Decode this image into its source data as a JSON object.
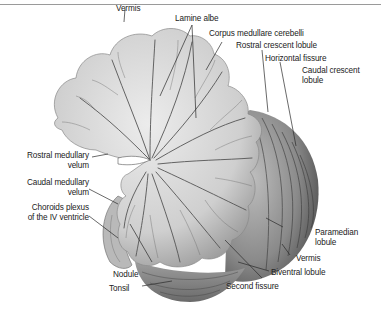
{
  "figure": {
    "labels": {
      "vermis_top": "Vermis",
      "lamine_albe": "Lamine albe",
      "corpus_medullare": "Corpus medullare cerebelli",
      "rostral_crescent": "Rostral crescent lobule",
      "horizontal_fissure": "Horizontal fissure",
      "caudal_crescent_1": "Caudal crescent",
      "caudal_crescent_2": "lobule",
      "rostral_medullary_1": "Rostral medullary",
      "rostral_medullary_2": "velum",
      "caudal_medullary_1": "Caudal medullary",
      "caudal_medullary_2": "velum",
      "choroids_1": "Choroids plexus",
      "choroids_2": "of the IV ventricle",
      "paramedian_1": "Paramedian",
      "paramedian_2": "lobule",
      "vermis_bottom": "Vermis",
      "biventral": "Biventral lobule",
      "nodule": "Nodule",
      "tonsil": "Tonsil",
      "second_fissure": "Second fissure"
    },
    "colors": {
      "white_matter": "#e6e6e6",
      "gray_matter": "#c4c4c4",
      "folia_dark": "#555555",
      "border": "#9a9a9a"
    }
  }
}
